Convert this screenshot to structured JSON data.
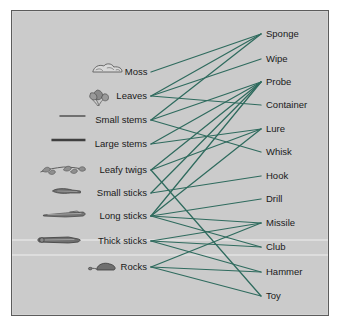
{
  "figure": {
    "panel_bg": "#cbcbcb",
    "panel_border": "#5c5c5c",
    "edge_color": "#2f6b5e",
    "label_color": "#1a1a1a",
    "icon_color": "#6e6e6e"
  },
  "left_nodes": [
    {
      "id": "moss",
      "label": "Moss",
      "icon": "moss-clump-icon",
      "x": 147,
      "y": 72
    },
    {
      "id": "leaves",
      "label": "Leaves",
      "icon": "leaf-cluster-icon",
      "x": 147,
      "y": 96
    },
    {
      "id": "small_stems",
      "label": "Small stems",
      "icon": "thin-line-icon",
      "x": 147,
      "y": 120
    },
    {
      "id": "large_stems",
      "label": "Large stems",
      "icon": "thick-line-icon",
      "x": 147,
      "y": 144
    },
    {
      "id": "leafy_twigs",
      "label": "Leafy twigs",
      "icon": "leafy-twig-icon",
      "x": 147,
      "y": 170
    },
    {
      "id": "small_sticks",
      "label": "Small sticks",
      "icon": "small-stick-icon",
      "x": 147,
      "y": 193
    },
    {
      "id": "long_sticks",
      "label": "Long sticks",
      "icon": "long-stick-icon",
      "x": 147,
      "y": 216
    },
    {
      "id": "thick_sticks",
      "label": "Thick sticks",
      "icon": "thick-stick-icon",
      "x": 147,
      "y": 241
    },
    {
      "id": "rocks",
      "label": "Rocks",
      "icon": "rock-icon",
      "x": 147,
      "y": 267
    }
  ],
  "right_nodes": [
    {
      "id": "sponge",
      "label": "Sponge",
      "x": 266,
      "y": 34
    },
    {
      "id": "wipe",
      "label": "Wipe",
      "x": 266,
      "y": 59
    },
    {
      "id": "probe",
      "label": "Probe",
      "x": 266,
      "y": 82
    },
    {
      "id": "container",
      "label": "Container",
      "x": 266,
      "y": 105
    },
    {
      "id": "lure",
      "label": "Lure",
      "x": 266,
      "y": 129
    },
    {
      "id": "whisk",
      "label": "Whisk",
      "x": 266,
      "y": 152
    },
    {
      "id": "hook",
      "label": "Hook",
      "x": 266,
      "y": 176
    },
    {
      "id": "drill",
      "label": "Drill",
      "x": 266,
      "y": 199
    },
    {
      "id": "missile",
      "label": "Missile",
      "x": 266,
      "y": 223
    },
    {
      "id": "club",
      "label": "Club",
      "x": 266,
      "y": 247
    },
    {
      "id": "hammer",
      "label": "Hammer",
      "x": 266,
      "y": 272
    },
    {
      "id": "toy",
      "label": "Toy",
      "x": 266,
      "y": 296
    }
  ],
  "edges": [
    {
      "from": "moss",
      "to": "sponge"
    },
    {
      "from": "leaves",
      "to": "sponge"
    },
    {
      "from": "leaves",
      "to": "wipe"
    },
    {
      "from": "leaves",
      "to": "container"
    },
    {
      "from": "small_stems",
      "to": "sponge"
    },
    {
      "from": "small_stems",
      "to": "probe"
    },
    {
      "from": "small_stems",
      "to": "whisk"
    },
    {
      "from": "large_stems",
      "to": "probe"
    },
    {
      "from": "large_stems",
      "to": "lure"
    },
    {
      "from": "leafy_twigs",
      "to": "probe"
    },
    {
      "from": "leafy_twigs",
      "to": "lure"
    },
    {
      "from": "leafy_twigs",
      "to": "toy"
    },
    {
      "from": "small_sticks",
      "to": "probe"
    },
    {
      "from": "small_sticks",
      "to": "hook"
    },
    {
      "from": "long_sticks",
      "to": "probe"
    },
    {
      "from": "long_sticks",
      "to": "lure"
    },
    {
      "from": "long_sticks",
      "to": "drill"
    },
    {
      "from": "long_sticks",
      "to": "missile"
    },
    {
      "from": "long_sticks",
      "to": "club"
    },
    {
      "from": "thick_sticks",
      "to": "missile"
    },
    {
      "from": "thick_sticks",
      "to": "club"
    },
    {
      "from": "thick_sticks",
      "to": "hammer"
    },
    {
      "from": "rocks",
      "to": "missile"
    },
    {
      "from": "rocks",
      "to": "hammer"
    },
    {
      "from": "rocks",
      "to": "toy"
    }
  ],
  "chart_data": {
    "type": "diagram",
    "subtype": "bipartite-graph",
    "left_categories": [
      "Moss",
      "Leaves",
      "Small stems",
      "Large stems",
      "Leafy twigs",
      "Small sticks",
      "Long sticks",
      "Thick sticks",
      "Rocks"
    ],
    "right_categories": [
      "Sponge",
      "Wipe",
      "Probe",
      "Container",
      "Lure",
      "Whisk",
      "Hook",
      "Drill",
      "Missile",
      "Club",
      "Hammer",
      "Toy"
    ],
    "links": [
      [
        "Moss",
        "Sponge"
      ],
      [
        "Leaves",
        "Sponge"
      ],
      [
        "Leaves",
        "Wipe"
      ],
      [
        "Leaves",
        "Container"
      ],
      [
        "Small stems",
        "Sponge"
      ],
      [
        "Small stems",
        "Probe"
      ],
      [
        "Small stems",
        "Whisk"
      ],
      [
        "Large stems",
        "Probe"
      ],
      [
        "Large stems",
        "Lure"
      ],
      [
        "Leafy twigs",
        "Probe"
      ],
      [
        "Leafy twigs",
        "Lure"
      ],
      [
        "Leafy twigs",
        "Toy"
      ],
      [
        "Small sticks",
        "Probe"
      ],
      [
        "Small sticks",
        "Hook"
      ],
      [
        "Long sticks",
        "Probe"
      ],
      [
        "Long sticks",
        "Lure"
      ],
      [
        "Long sticks",
        "Drill"
      ],
      [
        "Long sticks",
        "Missile"
      ],
      [
        "Long sticks",
        "Club"
      ],
      [
        "Thick sticks",
        "Missile"
      ],
      [
        "Thick sticks",
        "Club"
      ],
      [
        "Thick sticks",
        "Hammer"
      ],
      [
        "Rocks",
        "Missile"
      ],
      [
        "Rocks",
        "Hammer"
      ],
      [
        "Rocks",
        "Toy"
      ]
    ],
    "legend": [],
    "grid": false
  }
}
